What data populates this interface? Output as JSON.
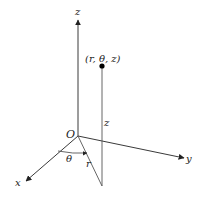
{
  "diagram": {
    "labels": {
      "z_axis": "z",
      "y_axis": "y",
      "x_axis": "x",
      "origin": "O",
      "point": "(r, θ, z)",
      "height": "z",
      "radius": "r",
      "angle": "θ"
    },
    "colors": {
      "line": "#3a3a3a",
      "text": "#222222",
      "point": "#000000"
    }
  }
}
